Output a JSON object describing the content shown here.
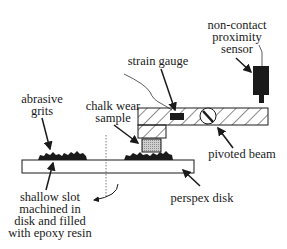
{
  "diagram": {
    "labels": {
      "sensor": [
        "non-contact",
        "proximity",
        "sensor"
      ],
      "strain_gauge": "strain gauge",
      "abrasive_grits": [
        "abrasive",
        "grits"
      ],
      "chalk_sample": [
        "chalk wear",
        "sample"
      ],
      "pivoted_beam": "pivoted beam",
      "perspex_disk": "perspex disk",
      "slot": [
        "shallow slot",
        "machined in",
        "disk and filled",
        "with epoxy resin"
      ]
    },
    "colors": {
      "line": "#1a1a1a",
      "sample_fill": "#c8c8c8",
      "background": "#ffffff"
    }
  }
}
